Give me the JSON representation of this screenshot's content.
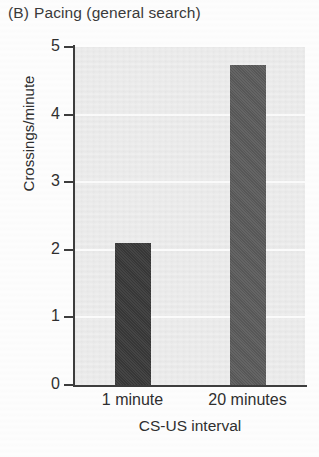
{
  "figure": {
    "panel_letter": "(B)",
    "title": "Pacing (general search)"
  },
  "chart_data": {
    "type": "bar",
    "categories": [
      "1 minute",
      "20 minutes"
    ],
    "values": [
      2.1,
      4.73
    ],
    "series": [
      {
        "name": "Crossings/minute",
        "values": [
          2.1,
          4.73
        ]
      }
    ],
    "xlabel": "CS-US interval",
    "ylabel": "Crossings/minute",
    "ylim": [
      0,
      5
    ],
    "yticks": [
      0,
      1,
      2,
      3,
      4,
      5
    ],
    "ytick_labels": [
      "0",
      "1",
      "2",
      "3",
      "4",
      "5"
    ],
    "grid": true,
    "grid_axis": "y",
    "legend": false,
    "bar_colors": [
      "#3a3a3a",
      "#5c5c5c"
    ],
    "plot_background": "#ececec"
  },
  "axes": {
    "y_title": "Crossings/minute",
    "x_title": "CS-US interval",
    "y_labels": [
      "5",
      "4",
      "3",
      "2",
      "1",
      "0"
    ],
    "x_labels": [
      "1 minute",
      "20 minutes"
    ]
  }
}
